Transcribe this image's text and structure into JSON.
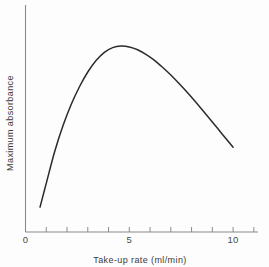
{
  "chart_data": {
    "type": "line",
    "title": "",
    "subtitle": "",
    "xlabel": "Take-up rate (ml/min)",
    "ylabel": "Maximum absorbance",
    "xlim": [
      0,
      11.2
    ],
    "ylim": [
      0,
      1.05
    ],
    "grid": false,
    "legend": null,
    "x_tick_labels": [
      "0",
      "5",
      "10"
    ],
    "x_tick_label_values": [
      0,
      5,
      10
    ],
    "x_minor_ticks": [
      1,
      2,
      3,
      4,
      6,
      7,
      8,
      9,
      11
    ],
    "y_tick_labels": [],
    "annotations": [],
    "series": [
      {
        "name": "Maximum absorbance vs take-up rate",
        "color": "#2b2b2b",
        "x": [
          0.7,
          1.0,
          1.4,
          1.8,
          2.2,
          2.6,
          3.0,
          3.4,
          3.8,
          4.2,
          4.6,
          5.0,
          5.4,
          5.8,
          6.2,
          6.6,
          7.0,
          7.5,
          8.0,
          8.5,
          9.0,
          9.5,
          10.0
        ],
        "y": [
          0.115,
          0.225,
          0.37,
          0.49,
          0.59,
          0.672,
          0.74,
          0.793,
          0.831,
          0.853,
          0.86,
          0.856,
          0.843,
          0.822,
          0.795,
          0.762,
          0.726,
          0.676,
          0.623,
          0.567,
          0.509,
          0.45,
          0.392
        ]
      }
    ],
    "peak": {
      "x": 4.6,
      "y": 0.86
    },
    "start_point": {
      "x": 0.7,
      "y": 0.115
    },
    "end_point": {
      "x": 10.0,
      "y": 0.392
    }
  },
  "figure": {
    "background_color": "#fdfdfd",
    "axis_color": "#8a8a8a",
    "curve_color": "#2b2b2b"
  }
}
